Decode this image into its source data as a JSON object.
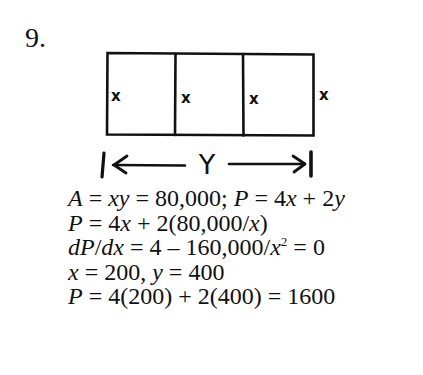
{
  "problem": {
    "number": "9."
  },
  "diagram": {
    "panels": 3,
    "side_labels": [
      "x",
      "x",
      "x",
      "x"
    ],
    "dimension_label": "Y",
    "stroke_color": "#111111"
  },
  "solution": {
    "lines": [
      {
        "parts": [
          {
            "t": "A",
            "i": true
          },
          {
            "t": " = ",
            "i": false
          },
          {
            "t": "xy",
            "i": true
          },
          {
            "t": " = 80,000;  ",
            "i": false
          },
          {
            "t": "P",
            "i": true
          },
          {
            "t": " = 4",
            "i": false
          },
          {
            "t": "x",
            "i": true
          },
          {
            "t": " + 2",
            "i": false
          },
          {
            "t": "y",
            "i": true
          }
        ],
        "text": "A = xy = 80,000;  P = 4x + 2y"
      },
      {
        "parts": [
          {
            "t": "P",
            "i": true
          },
          {
            "t": " = 4",
            "i": false
          },
          {
            "t": "x",
            "i": true
          },
          {
            "t": " + 2(80,000/",
            "i": false
          },
          {
            "t": "x",
            "i": true
          },
          {
            "t": ")",
            "i": false
          }
        ],
        "text": "P = 4x + 2(80,000/x)"
      },
      {
        "parts": [
          {
            "t": "dP",
            "i": true
          },
          {
            "t": "/",
            "i": false
          },
          {
            "t": "dx",
            "i": true
          },
          {
            "t": " = 4 – 160,000/",
            "i": false
          },
          {
            "t": "x",
            "i": true
          },
          {
            "t": "2",
            "sup": true
          },
          {
            "t": " = 0",
            "i": false
          }
        ],
        "text": "dP/dx = 4 – 160,000/x² = 0"
      },
      {
        "parts": [
          {
            "t": "x",
            "i": true
          },
          {
            "t": " = 200, ",
            "i": false
          },
          {
            "t": "y",
            "i": true
          },
          {
            "t": " = 400",
            "i": false
          }
        ],
        "text": "x = 200, y = 400"
      },
      {
        "parts": [
          {
            "t": "P",
            "i": true
          },
          {
            "t": " = 4(200) + 2(400) = 1600",
            "i": false
          }
        ],
        "text": "P = 4(200) + 2(400) = 1600"
      }
    ]
  }
}
